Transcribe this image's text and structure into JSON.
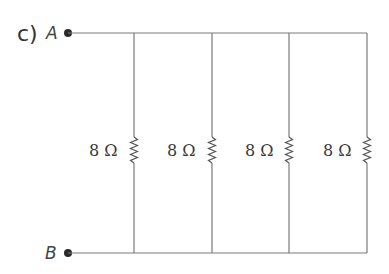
{
  "figure": {
    "part_label": "c)",
    "nodes": [
      {
        "id": "A",
        "label": "A",
        "x": 68,
        "y": 33
      },
      {
        "id": "B",
        "label": "B",
        "x": 68,
        "y": 253
      }
    ],
    "top_wire_y": 33,
    "bottom_wire_y": 253,
    "wire_end_x": 367,
    "resistors": [
      {
        "label": "8 Ω",
        "value": 8,
        "unit": "Ω",
        "x": 134
      },
      {
        "label": "8 Ω",
        "value": 8,
        "unit": "Ω",
        "x": 212
      },
      {
        "label": "8 Ω",
        "value": 8,
        "unit": "Ω",
        "x": 289
      },
      {
        "label": "8 Ω",
        "value": 8,
        "unit": "Ω",
        "x": 367
      }
    ],
    "arrangement": "parallel",
    "colors": {
      "wire": "#7a7a7a",
      "text": "#333333",
      "node": "#2a2a2a"
    }
  }
}
